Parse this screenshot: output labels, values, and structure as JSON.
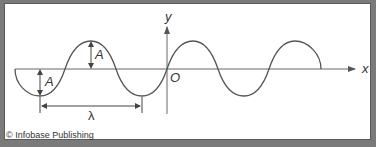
{
  "diagram": {
    "axes": {
      "x_label": "x",
      "y_label": "y",
      "origin_label": "O"
    },
    "annotations": {
      "amplitude_label": "A",
      "wavelength_label": "λ"
    },
    "wave": {
      "amplitude_px": 27,
      "wavelength_px": 102,
      "cycles_shown": 3,
      "stroke_color": "#555555"
    },
    "colors": {
      "frame": "#7a7a7a",
      "panel": "#ffffff",
      "line": "#555555"
    }
  },
  "footer": {
    "copyright": "© Infobase Publishing"
  }
}
